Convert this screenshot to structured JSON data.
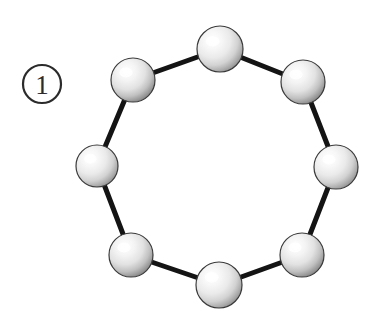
{
  "figure": {
    "background_color": "#ffffff",
    "label": {
      "name": "circled-number-label",
      "text": "1",
      "display": "①",
      "circle": {
        "cx": 42,
        "cy": 84,
        "r": 19
      },
      "stroke_color": "#2b2b2b",
      "stroke_width": 2.2,
      "text_color": "#2b2b2b"
    },
    "bond": {
      "color": "#141414",
      "width": 5,
      "count": 8
    },
    "sphere_style": {
      "outline_color": "#3a3a3a",
      "outline_width": 1.2,
      "highlight_color": "#ffffff",
      "midtone_color": "#e9e9e9",
      "shadow_color": "#8e8e8e",
      "highlight_offset": {
        "x": -0.32,
        "y": -0.34
      }
    },
    "spheres": [
      {
        "id": "sphere-top",
        "index": 1,
        "cx": 220,
        "cy": 49,
        "r": 23
      },
      {
        "id": "sphere-upper-right",
        "index": 2,
        "cx": 303,
        "cy": 82,
        "r": 22
      },
      {
        "id": "sphere-right",
        "index": 3,
        "cx": 336,
        "cy": 167,
        "r": 22
      },
      {
        "id": "sphere-lower-right",
        "index": 4,
        "cx": 302,
        "cy": 255,
        "r": 22
      },
      {
        "id": "sphere-bottom",
        "index": 5,
        "cx": 219,
        "cy": 285,
        "r": 23
      },
      {
        "id": "sphere-lower-left",
        "index": 6,
        "cx": 131,
        "cy": 255,
        "r": 22
      },
      {
        "id": "sphere-left",
        "index": 7,
        "cx": 97,
        "cy": 166,
        "r": 21
      },
      {
        "id": "sphere-upper-left",
        "index": 8,
        "cx": 133,
        "cy": 80,
        "r": 22
      }
    ],
    "bonds": [
      {
        "id": "bond-1-2",
        "from": 0,
        "to": 1
      },
      {
        "id": "bond-2-3",
        "from": 1,
        "to": 2
      },
      {
        "id": "bond-3-4",
        "from": 2,
        "to": 3
      },
      {
        "id": "bond-4-5",
        "from": 3,
        "to": 4
      },
      {
        "id": "bond-5-6",
        "from": 4,
        "to": 5
      },
      {
        "id": "bond-6-7",
        "from": 5,
        "to": 6
      },
      {
        "id": "bond-7-8",
        "from": 6,
        "to": 7
      },
      {
        "id": "bond-8-1",
        "from": 7,
        "to": 0
      }
    ]
  }
}
